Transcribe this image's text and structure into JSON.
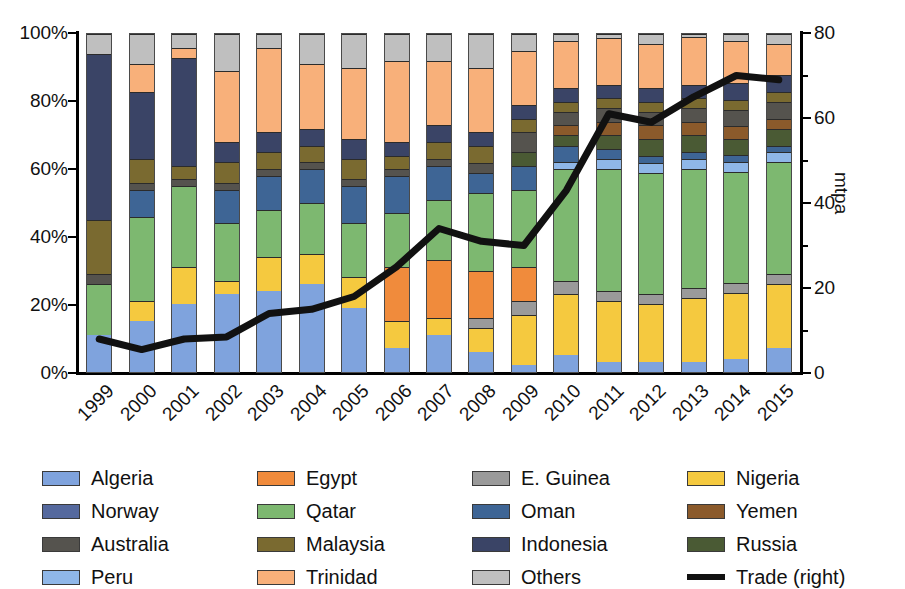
{
  "chart_data": {
    "type": "bar",
    "title": "",
    "subtitle": "",
    "xlabel": "",
    "ylabel": "",
    "ylabel_right": "mtpa",
    "grid": false,
    "legend_position": "bottom",
    "categories": [
      "1999",
      "2000",
      "2001",
      "2002",
      "2003",
      "2004",
      "2005",
      "2006",
      "2007",
      "2008",
      "2009",
      "2010",
      "2011",
      "2012",
      "2013",
      "2014",
      "2015"
    ],
    "ylim": [
      0,
      100
    ],
    "yticks": [
      "0%",
      "20%",
      "40%",
      "60%",
      "80%",
      "100%"
    ],
    "ylim_right": [
      0,
      80
    ],
    "yticks_right": [
      "0",
      "20",
      "40",
      "60",
      "80"
    ],
    "yticks_right_minor": [
      10,
      30,
      50,
      70
    ],
    "stack_note": "Values are percent share of stacked column (sum 100 per year).",
    "series": [
      {
        "name": "Algeria",
        "color": "#7FA3DD",
        "values": [
          11,
          15,
          20,
          23,
          24,
          26,
          19,
          7,
          11,
          6,
          2,
          5,
          3,
          3,
          3,
          4,
          7
        ]
      },
      {
        "name": "Nigeria",
        "color": "#F5C93F",
        "values": [
          0,
          6,
          11,
          4,
          10,
          9,
          9,
          8,
          5,
          7,
          15,
          18,
          18,
          17,
          19,
          20,
          19
        ]
      },
      {
        "name": "E. Guinea",
        "color": "#9A9A9A",
        "values": [
          0,
          0,
          0,
          0,
          0,
          0,
          0,
          0,
          0,
          3,
          4,
          4,
          3,
          3,
          3,
          3,
          3
        ]
      },
      {
        "name": "Egypt",
        "color": "#F08B3C",
        "values": [
          0,
          0,
          0,
          0,
          0,
          0,
          0,
          16,
          17,
          14,
          10,
          0,
          0,
          0,
          0,
          0,
          0
        ]
      },
      {
        "name": "Qatar",
        "color": "#7DB870",
        "values": [
          15,
          25,
          24,
          17,
          14,
          15,
          16,
          16,
          18,
          23,
          23,
          33,
          36,
          36,
          35,
          34,
          33
        ]
      },
      {
        "name": "Peru",
        "color": "#8FB7E8",
        "values": [
          0,
          0,
          0,
          0,
          0,
          0,
          0,
          0,
          0,
          0,
          0,
          2,
          3,
          3,
          3,
          3,
          3
        ]
      },
      {
        "name": "Oman",
        "color": "#3E6595",
        "values": [
          0,
          8,
          0,
          10,
          10,
          10,
          11,
          11,
          10,
          6,
          7,
          5,
          3,
          2,
          2,
          2,
          2
        ]
      },
      {
        "name": "Russia",
        "color": "#4A5A34",
        "values": [
          0,
          0,
          0,
          0,
          0,
          0,
          0,
          0,
          0,
          0,
          4,
          3,
          4,
          5,
          5,
          5,
          5
        ]
      },
      {
        "name": "Yemen",
        "color": "#8B5A2B",
        "values": [
          0,
          0,
          0,
          0,
          0,
          0,
          0,
          0,
          0,
          0,
          0,
          3,
          4,
          4,
          4,
          4,
          3
        ]
      },
      {
        "name": "Australia",
        "color": "#55534E",
        "values": [
          3,
          2,
          2,
          2,
          2,
          2,
          2,
          2,
          2,
          3,
          6,
          4,
          4,
          4,
          4,
          5,
          5
        ]
      },
      {
        "name": "Malaysia",
        "color": "#7A6A30",
        "values": [
          16,
          7,
          4,
          6,
          5,
          5,
          6,
          4,
          5,
          5,
          4,
          3,
          3,
          3,
          3,
          3,
          3
        ]
      },
      {
        "name": "Indonesia",
        "color": "#3A4466",
        "values": [
          49,
          20,
          32,
          6,
          6,
          5,
          6,
          4,
          5,
          4,
          4,
          4,
          4,
          4,
          4,
          5,
          5
        ]
      },
      {
        "name": "Trinidad",
        "color": "#F8B07A",
        "values": [
          0,
          8,
          3,
          21,
          25,
          19,
          21,
          24,
          19,
          19,
          16,
          14,
          14,
          13,
          14,
          13,
          9
        ]
      },
      {
        "name": "Others",
        "color": "#BFBFBF",
        "values": [
          6,
          9,
          4,
          11,
          4,
          9,
          10,
          8,
          8,
          10,
          5,
          2,
          1,
          3,
          1,
          2,
          3
        ]
      }
    ],
    "line_series": {
      "name": "Trade (right)",
      "color": "#111111",
      "unit": "mtpa",
      "axis": "right",
      "values": [
        8,
        5.5,
        8,
        8.5,
        14,
        15,
        18,
        25,
        34,
        31,
        30,
        43,
        61,
        59,
        65,
        70,
        69
      ]
    }
  },
  "legend": {
    "columns": [
      [
        {
          "label": "Algeria",
          "swatch": "algeria-swatch",
          "type": "box"
        },
        {
          "label": "Norway",
          "swatch": "norway-swatch",
          "type": "box"
        },
        {
          "label": "Australia",
          "swatch": "australia-swatch",
          "type": "box"
        },
        {
          "label": "Peru",
          "swatch": "peru-swatch",
          "type": "box"
        }
      ],
      [
        {
          "label": "Egypt",
          "swatch": "egypt-swatch",
          "type": "box"
        },
        {
          "label": "Qatar",
          "swatch": "qatar-swatch",
          "type": "box"
        },
        {
          "label": "Malaysia",
          "swatch": "malaysia-swatch",
          "type": "box"
        },
        {
          "label": "Trinidad",
          "swatch": "trinidad-swatch",
          "type": "box"
        }
      ],
      [
        {
          "label": "E. Guinea",
          "swatch": "eguinea-swatch",
          "type": "box"
        },
        {
          "label": "Oman",
          "swatch": "oman-swatch",
          "type": "box"
        },
        {
          "label": "Indonesia",
          "swatch": "indonesia-swatch",
          "type": "box"
        },
        {
          "label": "Others",
          "swatch": "others-swatch",
          "type": "box"
        }
      ],
      [
        {
          "label": "Nigeria",
          "swatch": "nigeria-swatch",
          "type": "box"
        },
        {
          "label": "Yemen",
          "swatch": "yemen-swatch",
          "type": "box"
        },
        {
          "label": "Russia",
          "swatch": "russia-swatch",
          "type": "box"
        },
        {
          "label": "Trade (right)",
          "swatch": "trade-line-swatch",
          "type": "line"
        }
      ]
    ],
    "colors": {
      "Algeria": "#7FA3DD",
      "Norway": "#55699E",
      "Australia": "#55534E",
      "Peru": "#8FB7E8",
      "Egypt": "#F08B3C",
      "Qatar": "#7DB870",
      "Malaysia": "#7A6A30",
      "Trinidad": "#F8B07A",
      "E. Guinea": "#9A9A9A",
      "Oman": "#3E6595",
      "Indonesia": "#3A4466",
      "Others": "#BFBFBF",
      "Nigeria": "#F5C93F",
      "Yemen": "#8B5A2B",
      "Russia": "#4A5A34",
      "Trade (right)": "#111111"
    }
  }
}
